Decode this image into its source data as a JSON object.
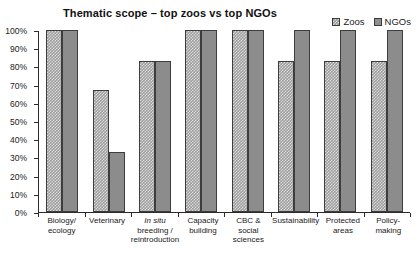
{
  "chart_data": {
    "type": "bar",
    "title": "Thematic scope – top zoos vs top NGOs",
    "xlabel": "",
    "ylabel": "",
    "ylim": [
      0,
      100
    ],
    "grid": false,
    "legend_position": "top-right",
    "categories": [
      "Biology/ ecology",
      "Veterinary",
      "In situ breeding / reintroduction",
      "Capacity building",
      "CBC & social sciences",
      "Sustainability",
      "Protected areas",
      "Policy- making"
    ],
    "category_lines": [
      [
        "Biology/",
        "ecology"
      ],
      [
        "Veterinary"
      ],
      [
        "In situ",
        "breeding /",
        "reintroduction"
      ],
      [
        "Capacity",
        "building"
      ],
      [
        "CBC &",
        "social",
        "sciences"
      ],
      [
        "Sustainability"
      ],
      [
        "Protected",
        "areas"
      ],
      [
        "Policy-",
        "making"
      ]
    ],
    "series": [
      {
        "name": "Zoos",
        "values": [
          100,
          67,
          83,
          100,
          100,
          83,
          83,
          83
        ]
      },
      {
        "name": "NGOs",
        "values": [
          100,
          33,
          83,
          100,
          100,
          100,
          100,
          100
        ]
      }
    ],
    "y_ticks": [
      "0%",
      "10%",
      "20%",
      "30%",
      "40%",
      "50%",
      "60%",
      "70%",
      "80%",
      "90%",
      "100%"
    ],
    "y_tick_values": [
      0,
      10,
      20,
      30,
      40,
      50,
      60,
      70,
      80,
      90,
      100
    ],
    "colors": {
      "zoos_fill": "#9d9d9d",
      "zoos_pattern": "#dcdcdc",
      "ngos_fill": "#8c8c8c",
      "bar_outline": "#3d3d3d",
      "axis": "#2b2b2b",
      "text": "#1a1a1a",
      "background": "#ffffff"
    }
  }
}
